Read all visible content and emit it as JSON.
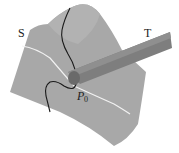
{
  "diagram": {
    "labels": {
      "surface": "S",
      "tube": "T",
      "point": "P",
      "point_subscript": "0"
    },
    "colors": {
      "background": "#ffffff",
      "surface": "#a8a8a8",
      "tube": "#7e7e7e",
      "tube_end": "#6a6a6a",
      "white_curve": "#f2f2f2",
      "black_curve": "#1a1a1a"
    }
  }
}
